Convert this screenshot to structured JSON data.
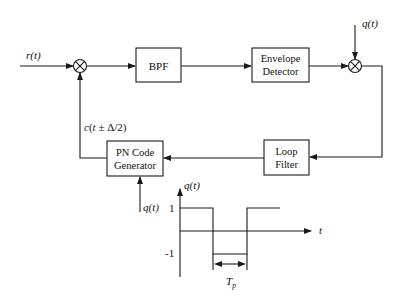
{
  "diagram": {
    "title": "",
    "blocks": {
      "bpf": {
        "label": "BPF"
      },
      "envelope_detector": {
        "line1": "Envelope",
        "line2": "Detector"
      },
      "loop_filter": {
        "line1": "Loop",
        "line2": "Filter"
      },
      "pn_code_generator": {
        "line1": "PN Code",
        "line2": "Generator"
      }
    },
    "signals": {
      "input": "r(t)",
      "feedback": "c(t ± Δ/2)",
      "dither_top": "q(t)",
      "dither_bottom": "q(t)"
    },
    "mixers": [
      "multiplier-1",
      "multiplier-2"
    ],
    "colors": {
      "stroke": "#1a1a1a",
      "background": "#ffffff"
    }
  },
  "waveform": {
    "y_axis_label": "q(t)",
    "x_axis_label": "t",
    "level_high": "1",
    "level_low": "-1",
    "period_label": "T",
    "period_subscript": "p"
  }
}
